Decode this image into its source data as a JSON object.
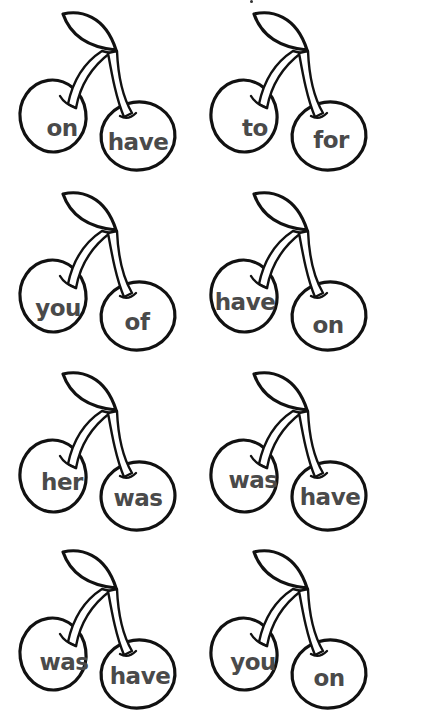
{
  "worksheet": {
    "stray_mark": true,
    "cherries": [
      {
        "left_word": "on",
        "right_word": "have"
      },
      {
        "left_word": "to",
        "right_word": "for"
      },
      {
        "left_word": "you",
        "right_word": "of"
      },
      {
        "left_word": "have",
        "right_word": "on"
      },
      {
        "left_word": "her",
        "right_word": "was"
      },
      {
        "left_word": "was",
        "right_word": "have"
      },
      {
        "left_word": "was",
        "right_word": "have"
      },
      {
        "left_word": "you",
        "right_word": "on"
      }
    ]
  },
  "colors": {
    "outline": "#111111",
    "word_text": "#4a4a4a",
    "background": "#ffffff"
  }
}
